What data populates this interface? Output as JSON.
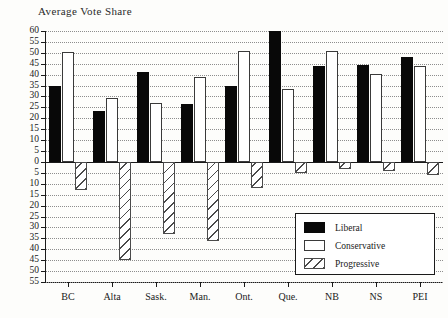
{
  "chart_data": {
    "type": "bar",
    "title": "Average Vote Share",
    "xlabel": "",
    "ylabel": "",
    "categories": [
      "BC",
      "Alta",
      "Sask.",
      "Man.",
      "Ont.",
      "Que.",
      "NB",
      "NS",
      "PEI"
    ],
    "series": [
      {
        "name": "Liberal",
        "values": [
          35,
          23.5,
          41,
          26.5,
          35,
          60,
          44,
          44.5,
          48
        ]
      },
      {
        "name": "Conservative",
        "values": [
          50.5,
          29.5,
          27,
          39,
          51,
          33.5,
          51,
          40.5,
          44
        ]
      },
      {
        "name": "Progressive",
        "values": [
          -13,
          -45,
          -33,
          -36,
          -12,
          -5,
          -3,
          -4,
          -6
        ]
      }
    ],
    "ylim": [
      -55,
      60
    ],
    "ytick_values": [
      60,
      55,
      50,
      45,
      40,
      35,
      30,
      25,
      20,
      15,
      10,
      5,
      0,
      -5,
      -10,
      -15,
      -20,
      -25,
      -30,
      -35,
      -40,
      -45,
      -50,
      -55
    ],
    "ytick_labels": [
      "60",
      "55",
      "50",
      "45",
      "40",
      "35",
      "30",
      "25",
      "20",
      "15",
      "10",
      "5",
      "0",
      "5",
      "10",
      "15",
      "20",
      "25",
      "30",
      "35",
      "40",
      "45",
      "50",
      "55"
    ],
    "grid": true,
    "legend_position": "inside-lower-right",
    "colors": {
      "liberal": "#080808",
      "conservative": "#ffffff",
      "progressive": "#ffffff",
      "axis": "#1a1a1a",
      "grid": "#8d8d8d",
      "background": "#fdfdfb"
    }
  },
  "legend": {
    "entries": [
      {
        "label": "Liberal",
        "swatch": "liberal"
      },
      {
        "label": "Conservative",
        "swatch": "conservative"
      },
      {
        "label": "Progressive",
        "swatch": "progressive"
      }
    ]
  }
}
